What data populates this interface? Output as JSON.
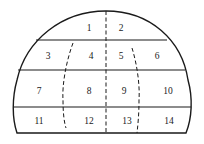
{
  "diagram": {
    "line_color": "#1a1a1a",
    "background": "#ffffff",
    "regions": [
      {
        "id": 1,
        "label": "1",
        "x": 89,
        "y": 28
      },
      {
        "id": 2,
        "label": "2",
        "x": 121,
        "y": 28
      },
      {
        "id": 3,
        "label": "3",
        "x": 48,
        "y": 56
      },
      {
        "id": 4,
        "label": "4",
        "x": 91,
        "y": 56
      },
      {
        "id": 5,
        "label": "5",
        "x": 121,
        "y": 56
      },
      {
        "id": 6,
        "label": "6",
        "x": 157,
        "y": 56
      },
      {
        "id": 7,
        "label": "7",
        "x": 39,
        "y": 91
      },
      {
        "id": 8,
        "label": "8",
        "x": 89,
        "y": 91
      },
      {
        "id": 9,
        "label": "9",
        "x": 124,
        "y": 91
      },
      {
        "id": 10,
        "label": "10",
        "x": 168,
        "y": 91
      },
      {
        "id": 11,
        "label": "11",
        "x": 39,
        "y": 121
      },
      {
        "id": 12,
        "label": "12",
        "x": 89,
        "y": 121
      },
      {
        "id": 13,
        "label": "13",
        "x": 127,
        "y": 121
      },
      {
        "id": 14,
        "label": "14",
        "x": 169,
        "y": 121
      }
    ]
  }
}
